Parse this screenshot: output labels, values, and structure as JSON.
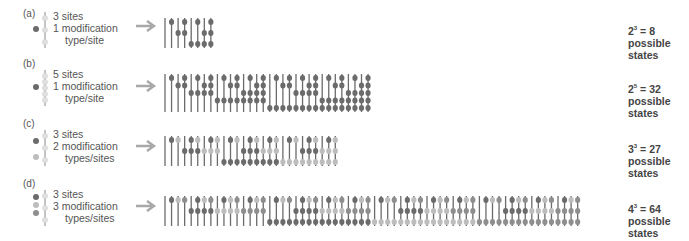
{
  "colors": {
    "mod1": "#6b6b6b",
    "mod2": "#bdbdbd",
    "mod3": "#8e8e8e",
    "line": "#6b6b6b",
    "arrow": "#a8a8a8",
    "site_empty": "#e0e0e0"
  },
  "panels": [
    {
      "label": "(a)",
      "desc": [
        "3 sites",
        "1 modification",
        "type/site"
      ],
      "sites": 3,
      "types": 1,
      "result_base": "2",
      "result_exp": "3",
      "result_eq": " = 8",
      "result_l2": "possible",
      "result_l3": "states",
      "count": 8
    },
    {
      "label": "(b)",
      "desc": [
        "5 sites",
        "1 modification",
        "type/site"
      ],
      "sites": 5,
      "types": 1,
      "result_base": "2",
      "result_exp": "5",
      "result_eq": " = 32",
      "result_l2": "possible",
      "result_l3": "states",
      "count": 32
    },
    {
      "label": "(c)",
      "desc": [
        "3 sites",
        "2 modification",
        "types/sites"
      ],
      "sites": 3,
      "types": 2,
      "result_base": "3",
      "result_exp": "3",
      "result_eq": " = 27",
      "result_l2": "possible",
      "result_l3": "states",
      "count": 27
    },
    {
      "label": "(d)",
      "desc": [
        "3 sites",
        "3 modification",
        "types/sites"
      ],
      "sites": 3,
      "types": 3,
      "result_base": "4",
      "result_exp": "3",
      "result_eq": " = 64",
      "result_l2": "possible",
      "result_l3": "states",
      "count": 64
    }
  ]
}
